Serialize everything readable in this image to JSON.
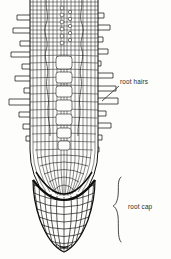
{
  "figure": {
    "background_color": "#fdfdfc",
    "ink_color": "#1a1a1a",
    "text_color": "#2a2a2a"
  },
  "labels": {
    "root_hairs": {
      "text": "root hairs",
      "x": 120,
      "y": 84,
      "leader": "diagonal-line-down-left",
      "points_to": "root-hair-on-right-flank"
    },
    "root_cap": {
      "text": "root cap",
      "x": 129,
      "y": 210,
      "leader": "curly-brace",
      "brace_top": 176,
      "brace_bottom": 243
    }
  },
  "structures": {
    "root_body": {
      "name": "root-body",
      "description": "elongated root axis with vertical cell files and transverse walls"
    },
    "root_cap_dome": {
      "name": "root-cap-dome",
      "description": "bullet shaped dome of curved grid cells at the root tip"
    },
    "boundary_arc": {
      "name": "root-cap-boundary-arc",
      "description": "dark curved arc separating root apex from root cap"
    },
    "hairs_left_count": 11,
    "hairs_right_count": 11
  }
}
